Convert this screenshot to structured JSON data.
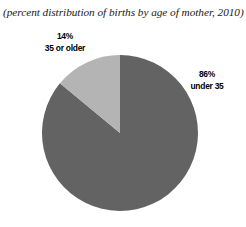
{
  "figure": {
    "subtitle": "(percent distribution of births by age of mother, 2010)",
    "background_color": "#ffffff"
  },
  "labels": {
    "older": {
      "percent": "14%",
      "group": "35 or older"
    },
    "under": {
      "percent": "86%",
      "group": "under 35"
    }
  },
  "chart_data": {
    "type": "pie",
    "title": "",
    "subtitle": "(percent distribution of births by age of mother, 2010)",
    "xlabel": "",
    "ylabel": "",
    "categories": [
      "under 35",
      "35 or older"
    ],
    "values": [
      86,
      14
    ],
    "units": "percent",
    "labels": [
      "86%\nunder 35",
      "14%\n35 or older"
    ],
    "colors": [
      "#636363",
      "#b4b4b4"
    ],
    "start_angle_deg": 90,
    "direction": "counterclockwise",
    "legend": "none",
    "grid": false,
    "annotations": [
      {
        "text": "14%",
        "series": "35 or older",
        "position": "upper-left-outside"
      },
      {
        "text": "35 or older",
        "series": "35 or older",
        "position": "upper-left-outside"
      },
      {
        "text": "86%",
        "series": "under 35",
        "position": "right-outside"
      },
      {
        "text": "under 35",
        "series": "under 35",
        "position": "right-outside"
      }
    ],
    "geometry": {
      "center_x": 120,
      "center_y": 133,
      "radius": 78
    }
  }
}
